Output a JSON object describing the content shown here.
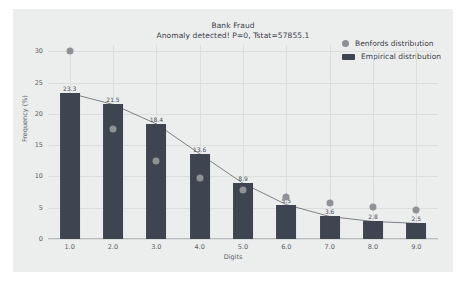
{
  "chart_data": {
    "type": "bar",
    "title": "Bank Fraud",
    "subtitle": "Anomaly detected! P=0, Tstat=57855.1",
    "xlabel": "Digits",
    "ylabel": "Frequency (%)",
    "categories": [
      "1.0",
      "2.0",
      "3.0",
      "4.0",
      "5.0",
      "6.0",
      "7.0",
      "8.0",
      "9.0"
    ],
    "x": [
      1,
      2,
      3,
      4,
      5,
      6,
      7,
      8,
      9
    ],
    "ylim": [
      0,
      31
    ],
    "yticks": [
      "0",
      "5",
      "10",
      "15",
      "20",
      "25",
      "30"
    ],
    "ytick_values": [
      0,
      5,
      10,
      15,
      20,
      25,
      30
    ],
    "grid": true,
    "legend_position": "top-right",
    "series": [
      {
        "name": "Empirical distribution",
        "kind": "bar",
        "color": "#3e4550",
        "values": [
          23.3,
          21.5,
          18.4,
          13.6,
          8.9,
          5.5,
          3.6,
          2.8,
          2.5
        ],
        "labels": [
          "23.3",
          "21.5",
          "18.4",
          "13.6",
          "8.9",
          "5.5",
          "3.6",
          "2.8",
          "2.5"
        ]
      },
      {
        "name": "Benfords distribution",
        "kind": "scatter-line",
        "color": "#8e9195",
        "values": [
          30.1,
          17.6,
          12.5,
          9.7,
          7.9,
          6.7,
          5.8,
          5.1,
          4.6
        ]
      }
    ]
  },
  "legend": {
    "items": [
      {
        "label": "Benfords distribution",
        "marker": "dot",
        "color": "#8c8f93"
      },
      {
        "label": "Empirical distribution",
        "marker": "bar",
        "color": "#3e4550"
      }
    ]
  }
}
